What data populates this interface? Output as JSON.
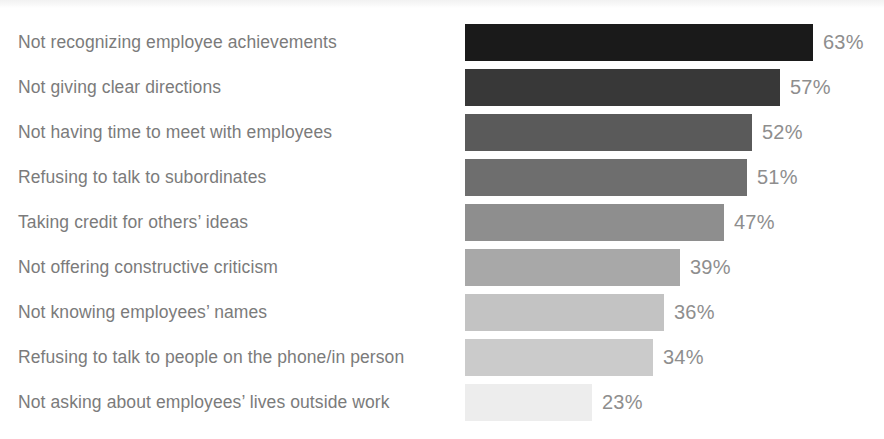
{
  "chart_data": {
    "type": "bar",
    "orientation": "horizontal",
    "title": "",
    "subtitle": "",
    "xlabel": "",
    "ylabel": "",
    "grid": false,
    "legend": false,
    "xlim": [
      0,
      70
    ],
    "value_suffix": "%",
    "categories": [
      "Not recognizing employee achievements",
      "Not giving clear directions",
      "Not having time to meet with employees",
      "Refusing to talk to subordinates",
      "Taking credit for others’ ideas",
      "Not offering constructive criticism",
      "Not knowing employees’ names",
      "Refusing to talk to people on the phone/in person",
      "Not asking about employees’ lives outside work"
    ],
    "values": [
      63,
      57,
      52,
      51,
      47,
      39,
      36,
      34,
      23
    ],
    "value_labels": [
      "63%",
      "57%",
      "52%",
      "51%",
      "47%",
      "39%",
      "36%",
      "34%",
      "23%"
    ],
    "bar_colors": [
      "#1a1a1a",
      "#383838",
      "#5a5a5a",
      "#6e6e6e",
      "#8e8e8e",
      "#a8a8a8",
      "#c3c3c3",
      "#cbcbcb",
      "#ededed"
    ],
    "label_color": "#7b7b7b",
    "value_color": "#8e8e8e",
    "background_color": "#ffffff"
  }
}
